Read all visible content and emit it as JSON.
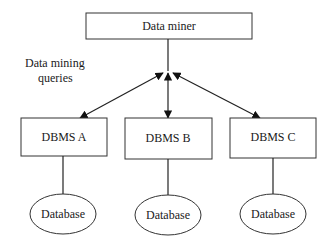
{
  "diagram": {
    "data_miner": {
      "label": "Data miner"
    },
    "queries_label": {
      "line1": "Data mining",
      "line2": "queries"
    },
    "dbms": [
      {
        "label": "DBMS A",
        "database_label": "Database"
      },
      {
        "label": "DBMS B",
        "database_label": "Database"
      },
      {
        "label": "DBMS C",
        "database_label": "Database"
      }
    ],
    "colors": {
      "stroke": "#222222",
      "background": "#ffffff",
      "text": "#1a1a1a"
    }
  }
}
